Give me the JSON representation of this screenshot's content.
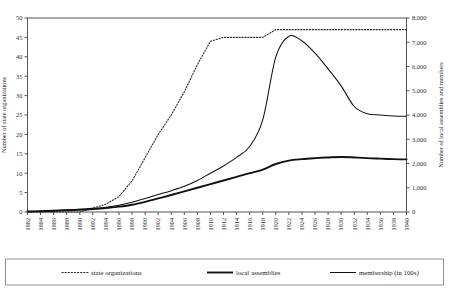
{
  "chart_data": {
    "type": "line",
    "title": "",
    "xlabel": "",
    "ylabel": "Number of state organizations",
    "y2label": "Number of local assemblies and members",
    "grid": false,
    "legend_position": "bottom",
    "ylim": [
      0,
      50
    ],
    "y2lim": [
      0,
      8000
    ],
    "xlim": [
      1882,
      1940
    ],
    "yticks": [
      0,
      5,
      10,
      15,
      20,
      25,
      30,
      35,
      40,
      45,
      50
    ],
    "ytick_labels": [
      "0",
      "5",
      "10",
      "15",
      "20",
      "25",
      "30",
      "35",
      "40",
      "45",
      "50"
    ],
    "y2ticks": [
      0,
      1000,
      2000,
      3000,
      4000,
      5000,
      6000,
      7000,
      8000
    ],
    "y2tick_labels": [
      "0",
      "1,000",
      "2,000",
      "3,000",
      "4,000",
      "5,000",
      "6,000",
      "7,000",
      "8,000"
    ],
    "x": [
      1882,
      1884,
      1886,
      1888,
      1890,
      1892,
      1894,
      1896,
      1898,
      1900,
      1902,
      1904,
      1906,
      1908,
      1910,
      1912,
      1914,
      1916,
      1918,
      1920,
      1922,
      1924,
      1926,
      1928,
      1930,
      1932,
      1934,
      1936,
      1938,
      1940
    ],
    "xtick_labels": [
      "1882",
      "1884",
      "1886",
      "1888",
      "1890",
      "1892",
      "1894",
      "1896",
      "1898",
      "1900",
      "1902",
      "1904",
      "1906",
      "1908",
      "1910",
      "1912",
      "1914",
      "1916",
      "1918",
      "1920",
      "1922",
      "1924",
      "1926",
      "1928",
      "1930",
      "1932",
      "1934",
      "1936",
      "1938",
      "1940"
    ],
    "series": [
      {
        "name": "state organizations",
        "style": "dotted",
        "axis": "left",
        "values": [
          0,
          0,
          0,
          0,
          0,
          1,
          2,
          4,
          8,
          14,
          20,
          25,
          31,
          38,
          44,
          45,
          45,
          45,
          45,
          47,
          47,
          47,
          47,
          47,
          47,
          47,
          47,
          47,
          47,
          47
        ]
      },
      {
        "name": "local assemblies",
        "style": "solid-thick",
        "axis": "right",
        "values": [
          20,
          30,
          50,
          70,
          90,
          120,
          160,
          220,
          300,
          420,
          560,
          700,
          850,
          1000,
          1150,
          1300,
          1450,
          1600,
          1750,
          1980,
          2120,
          2180,
          2220,
          2250,
          2270,
          2250,
          2220,
          2200,
          2180,
          2170
        ]
      },
      {
        "name": "membership (in 100s)",
        "style": "solid-thin",
        "axis": "right",
        "values": [
          20,
          30,
          50,
          80,
          110,
          150,
          200,
          280,
          400,
          560,
          720,
          880,
          1060,
          1300,
          1600,
          1900,
          2250,
          2700,
          3800,
          6400,
          7250,
          7050,
          6550,
          5900,
          5200,
          4350,
          4050,
          4000,
          3960,
          3950
        ]
      }
    ],
    "legend": [
      {
        "label": "state organizations",
        "style": "dotted"
      },
      {
        "label": "local assemblies",
        "style": "solid-thick"
      },
      {
        "label": "membership (in 100s)",
        "style": "solid-thin"
      }
    ]
  }
}
